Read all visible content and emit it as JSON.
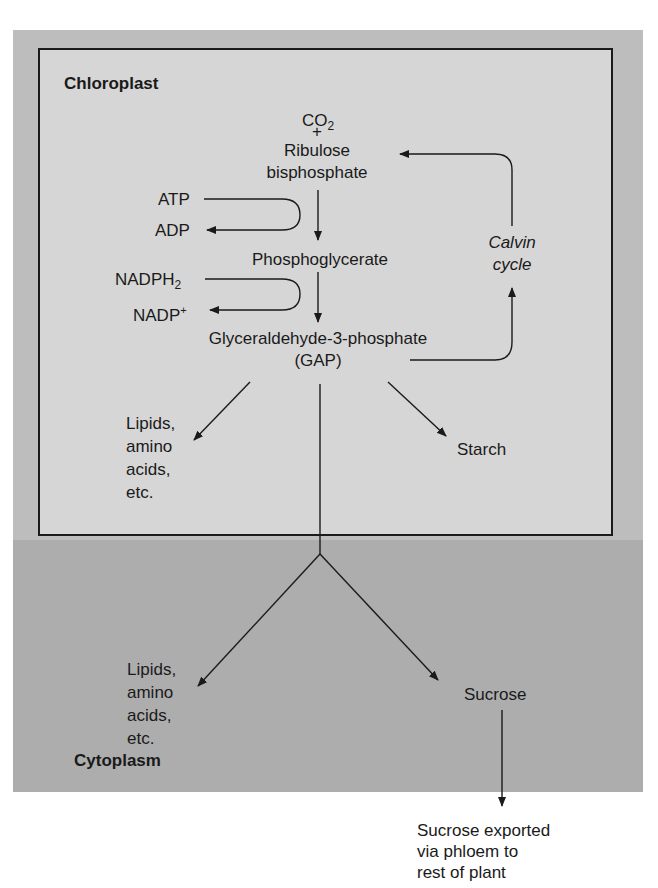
{
  "compartments": {
    "chloroplast": "Chloroplast",
    "cytoplasm": "Cytoplasm"
  },
  "nodes": {
    "co2": "CO",
    "co2_sub": "2",
    "plus": "+",
    "rubp": "Ribulose\nbisphosphate",
    "atp": "ATP",
    "adp": "ADP",
    "pga": "Phosphoglycerate",
    "nadph": "NADPH",
    "nadph_sub": "2",
    "nadp": "NADP",
    "nadp_sup": "+",
    "gap": "Glyceraldehyde-3-phosphate\n(GAP)",
    "calvin": "Calvin\ncycle",
    "lipids_chloro": "Lipids,\namino\nacids,\netc.",
    "starch": "Starch",
    "lipids_cyto": "Lipids,\namino\nacids,\netc.",
    "sucrose": "Sucrose",
    "export": "Sucrose exported\nvia phloem to\nrest of plant"
  }
}
